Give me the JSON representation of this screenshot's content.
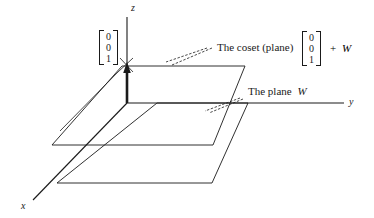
{
  "figure": {
    "background_color": "#ffffff",
    "ink_color": "#1a1a1a",
    "width": 374,
    "height": 218
  },
  "axes": {
    "x_label": "x",
    "y_label": "y",
    "z_label": "z",
    "origin": {
      "x": 127,
      "y": 103
    }
  },
  "vectors": {
    "left": {
      "name": "translation-vector",
      "entries": [
        "0",
        "0",
        "1"
      ]
    },
    "right": {
      "name": "coset-vector",
      "entries": [
        "0",
        "0",
        "1"
      ]
    }
  },
  "callouts": {
    "coset": {
      "text": "The coset (plane)",
      "suffix_plus": "+",
      "suffix_subspace": "W"
    },
    "plane": {
      "text_prefix": "The plane",
      "text_subspace": "W"
    }
  },
  "planes": {
    "upper": {
      "name": "coset-plane",
      "corners": [
        [
          122,
          66
        ],
        [
          245,
          66
        ],
        [
          213,
          145
        ],
        [
          52,
          145
        ]
      ]
    },
    "lower": {
      "name": "subspace-plane-w",
      "corners": [
        [
          157,
          103
        ],
        [
          248,
          103
        ],
        [
          212,
          183
        ],
        [
          57,
          183
        ]
      ]
    }
  }
}
